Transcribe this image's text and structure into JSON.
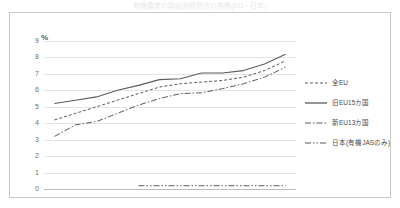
{
  "title": {
    "text": "有機農業の取組面積割合の推移(EU・日本)"
  },
  "axis": {
    "y_unit": "%",
    "y_ticks": [
      "9",
      "8",
      "7",
      "6",
      "5",
      "4",
      "3",
      "2",
      "1",
      "0"
    ],
    "x_ticks": [
      "2005",
      "2006",
      "2007",
      "2008",
      "2009",
      "2010",
      "2011",
      "2012",
      "2013",
      "2014",
      "2015",
      "2016"
    ]
  },
  "legend": {
    "items": [
      {
        "label": "全EU",
        "style": "dashed"
      },
      {
        "label": "旧EU15カ国",
        "style": "solid"
      },
      {
        "label": "新EU13カ国",
        "style": "dashdot"
      },
      {
        "label": "日本(有機JASのみ)",
        "style": "dashdotdot"
      }
    ]
  },
  "colors": {
    "line": "#5a5a5a",
    "grid": "#e4e4e4",
    "axis": "#bdbdbd",
    "border": "#c9c9c9",
    "text": "#6f6f6f"
  },
  "chart_data": {
    "type": "line",
    "title": "有機農業の取組面積割合の推移(EU・日本)",
    "xlabel": "",
    "ylabel": "%",
    "ylim": [
      0,
      9
    ],
    "grid": true,
    "legend_position": "right",
    "x": [
      "2005",
      "2006",
      "2007",
      "2008",
      "2009",
      "2010",
      "2011",
      "2012",
      "2013",
      "2014",
      "2015",
      "2016"
    ],
    "series": [
      {
        "name": "全EU",
        "style": "dashed",
        "values": [
          4.2,
          4.6,
          5.0,
          5.4,
          5.8,
          6.2,
          6.4,
          6.5,
          6.6,
          6.8,
          7.2,
          7.8
        ]
      },
      {
        "name": "旧EU15カ国",
        "style": "solid",
        "values": [
          5.2,
          5.4,
          5.6,
          6.0,
          6.3,
          6.65,
          6.7,
          7.05,
          7.05,
          7.2,
          7.6,
          8.2
        ]
      },
      {
        "name": "新EU13カ国",
        "style": "dashdot",
        "values": [
          3.2,
          3.9,
          4.1,
          4.6,
          5.1,
          5.5,
          5.8,
          5.85,
          6.1,
          6.4,
          6.8,
          7.4
        ]
      },
      {
        "name": "日本(有機JASのみ)",
        "style": "dashdotdot",
        "values": [
          null,
          null,
          null,
          null,
          0.2,
          0.2,
          0.2,
          0.2,
          0.2,
          0.2,
          0.2,
          0.2
        ]
      }
    ]
  }
}
